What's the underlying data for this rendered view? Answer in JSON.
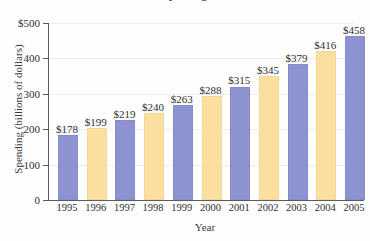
{
  "chart_data": {
    "type": "bar",
    "title": "Spending",
    "xlabel": "Year",
    "ylabel": "Spending (billions of dollars)",
    "categories": [
      "1995",
      "1996",
      "1997",
      "1998",
      "1999",
      "2000",
      "2001",
      "2002",
      "2003",
      "2004",
      "2005"
    ],
    "values": [
      178,
      199,
      219,
      240,
      263,
      288,
      315,
      345,
      379,
      416,
      458
    ],
    "data_labels": [
      "$178",
      "$199",
      "$219",
      "$240",
      "$263",
      "$288",
      "$315",
      "$345",
      "$379",
      "$416",
      "$458"
    ],
    "bar_colors": [
      "blue",
      "cream",
      "blue",
      "cream",
      "blue",
      "cream",
      "blue",
      "cream",
      "blue",
      "cream",
      "blue"
    ],
    "ylim": [
      0,
      500
    ],
    "ytick_values": [
      500,
      400,
      300,
      200,
      100,
      0
    ],
    "ytick_labels": [
      "$500",
      "400",
      "300",
      "200",
      "100",
      "0"
    ],
    "grid": true,
    "legend": "none",
    "colors": {
      "blue": "#8d93d1",
      "cream": "#fadf9f",
      "axis": "#5b5b5b",
      "gridline": "#ececec",
      "text": "#2e2e2e",
      "background": "#fefefe"
    }
  }
}
